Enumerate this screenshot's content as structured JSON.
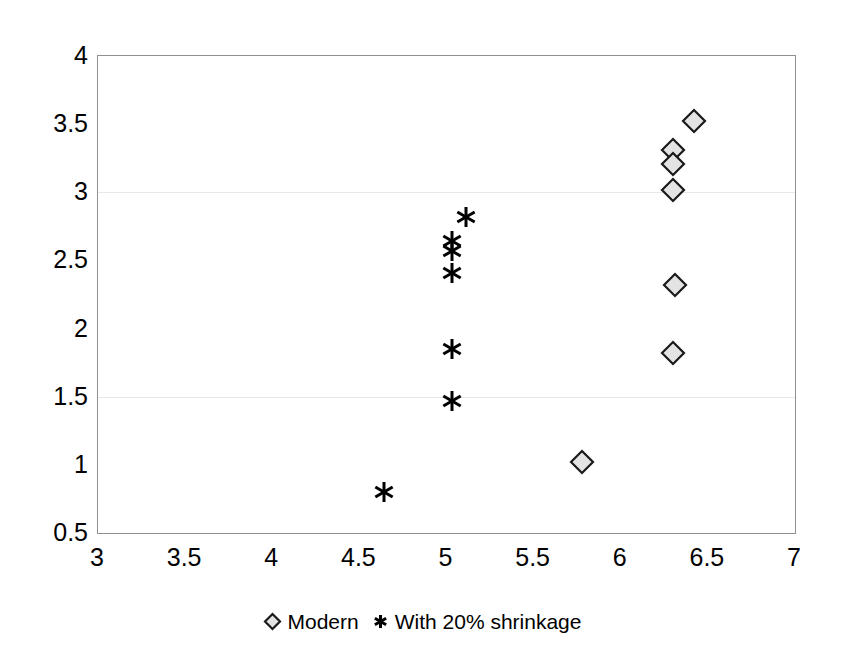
{
  "chart_data": {
    "type": "scatter",
    "title": "",
    "subtitle": "",
    "xlabel": "",
    "ylabel": "",
    "xlim": [
      3,
      7
    ],
    "ylim": [
      0.5,
      4
    ],
    "xticks": [
      "3",
      "3.5",
      "4",
      "4.5",
      "5",
      "5.5",
      "6",
      "6.5",
      "7"
    ],
    "xtick_values": [
      3,
      3.5,
      4,
      4.5,
      5,
      5.5,
      6,
      6.5,
      7
    ],
    "yticks": [
      "0.5",
      "1",
      "1.5",
      "2",
      "2.5",
      "3",
      "3.5",
      "4"
    ],
    "ytick_values": [
      0.5,
      1,
      1.5,
      2,
      2.5,
      3,
      3.5,
      4
    ],
    "grid": true,
    "gridlines_y": [
      1.5,
      3
    ],
    "legend_position": "bottom",
    "series": [
      {
        "name": "Modern",
        "marker": "diamond",
        "marker_fill": "#e3e3e3",
        "marker_stroke": "#1a1a1a",
        "points": [
          {
            "x": 6.42,
            "y": 3.52
          },
          {
            "x": 6.3,
            "y": 3.31
          },
          {
            "x": 6.3,
            "y": 3.21
          },
          {
            "x": 6.3,
            "y": 3.02
          },
          {
            "x": 6.31,
            "y": 2.32
          },
          {
            "x": 6.3,
            "y": 1.82
          },
          {
            "x": 5.78,
            "y": 1.02
          }
        ]
      },
      {
        "name": "With 20% shrinkage",
        "marker": "asterisk",
        "marker_fill": "#000000",
        "marker_stroke": "#000000",
        "points": [
          {
            "x": 5.11,
            "y": 2.82
          },
          {
            "x": 5.03,
            "y": 2.64
          },
          {
            "x": 5.03,
            "y": 2.57
          },
          {
            "x": 5.03,
            "y": 2.41
          },
          {
            "x": 5.03,
            "y": 1.85
          },
          {
            "x": 5.03,
            "y": 1.47
          },
          {
            "x": 4.64,
            "y": 0.8
          }
        ]
      }
    ]
  },
  "legend": {
    "entries": [
      {
        "label": "Modern",
        "marker": "diamond"
      },
      {
        "label": "With 20% shrinkage",
        "marker": "asterisk"
      }
    ]
  },
  "colors": {
    "axis": "#8f8f8f",
    "grid": "#e8e8e8",
    "text": "#000000",
    "diamond_fill": "#e3e3e3",
    "diamond_stroke": "#1a1a1a",
    "asterisk": "#000000",
    "background": "#ffffff"
  }
}
